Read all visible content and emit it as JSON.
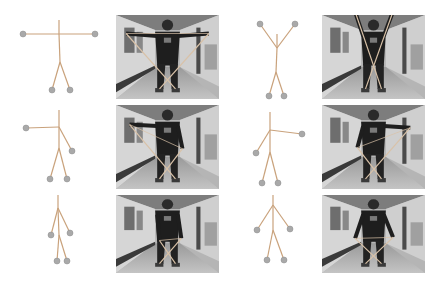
{
  "figure": {
    "colors": {
      "bone": "#c9a27c",
      "joint": "#a9a9a9",
      "joint_stroke": "#8c8c8c",
      "background": "#ffffff"
    },
    "poses": [
      {
        "id": "pose-1",
        "label": "arms-horizontal-overhead-band",
        "skeleton": {
          "head_top": [
            59,
            20
          ],
          "neck": [
            59,
            34
          ],
          "hip": [
            60,
            62
          ],
          "left_hand": [
            23,
            34
          ],
          "right_hand": [
            95,
            34
          ],
          "left_foot": [
            52,
            90
          ],
          "right_foot": [
            70,
            90
          ]
        },
        "photo": {
          "x": 116,
          "y": 15,
          "w": 103,
          "h": 84
        }
      },
      {
        "id": "pose-2",
        "label": "arms-raised-v",
        "skeleton": {
          "head_top": [
            277,
            34
          ],
          "neck": [
            277,
            48
          ],
          "hip": [
            276,
            72
          ],
          "left_hand": [
            260,
            24
          ],
          "right_hand": [
            295,
            24
          ],
          "left_foot": [
            269,
            96
          ],
          "right_foot": [
            284,
            96
          ]
        },
        "photo": {
          "x": 322,
          "y": 15,
          "w": 103,
          "h": 84
        }
      },
      {
        "id": "pose-3",
        "label": "left-arm-extended",
        "skeleton": {
          "head_top": [
            59,
            110
          ],
          "neck": [
            59,
            127
          ],
          "hip": [
            59,
            148
          ],
          "left_hand": [
            26,
            128
          ],
          "right_hand": [
            72,
            151
          ],
          "left_foot": [
            50,
            179
          ],
          "right_foot": [
            67,
            179
          ]
        },
        "photo": {
          "x": 116,
          "y": 105,
          "w": 103,
          "h": 84
        }
      },
      {
        "id": "pose-4",
        "label": "right-arm-extended",
        "skeleton": {
          "head_top": [
            270,
            112
          ],
          "neck": [
            270,
            130
          ],
          "hip": [
            270,
            152
          ],
          "left_hand": [
            256,
            153
          ],
          "right_hand": [
            302,
            134
          ],
          "left_foot": [
            262,
            183
          ],
          "right_foot": [
            278,
            183
          ]
        },
        "photo": {
          "x": 322,
          "y": 105,
          "w": 103,
          "h": 84
        }
      },
      {
        "id": "pose-5",
        "label": "arms-down-narrow",
        "skeleton": {
          "head_top": [
            58,
            195
          ],
          "neck": [
            58,
            208
          ],
          "hip": [
            59,
            235
          ],
          "left_hand": [
            51,
            235
          ],
          "right_hand": [
            70,
            233
          ],
          "left_foot": [
            57,
            261
          ],
          "right_foot": [
            67,
            261
          ]
        },
        "photo": {
          "x": 116,
          "y": 195,
          "w": 103,
          "h": 78
        }
      },
      {
        "id": "pose-6",
        "label": "arms-down-wide",
        "skeleton": {
          "head_top": [
            273,
            195
          ],
          "neck": [
            273,
            205
          ],
          "hip": [
            273,
            230
          ],
          "left_hand": [
            257,
            230
          ],
          "right_hand": [
            290,
            229
          ],
          "left_foot": [
            267,
            260
          ],
          "right_foot": [
            284,
            260
          ]
        },
        "photo": {
          "x": 322,
          "y": 195,
          "w": 103,
          "h": 78
        }
      }
    ]
  }
}
